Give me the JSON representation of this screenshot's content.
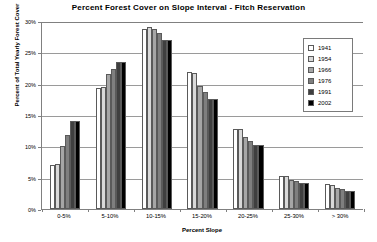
{
  "chart_data": {
    "type": "bar",
    "title": "Percent Forest Cover on Slope Interval - Fitch Reservation",
    "xlabel": "Percent Slope",
    "ylabel": "Percent of Total Yearly Forest Cover",
    "categories": [
      "0-5%",
      "5-10%",
      "10-15%",
      "15-20%",
      "20-25%",
      "25-30%",
      "> 30%"
    ],
    "ylim": [
      0,
      30
    ],
    "ytick_labels": [
      "0%",
      "5%",
      "10%",
      "15%",
      "20%",
      "25%",
      "30%"
    ],
    "ytick_values": [
      0,
      5,
      10,
      15,
      20,
      25,
      30
    ],
    "grid": true,
    "legend_position": "right-inside",
    "series": [
      {
        "name": "1941",
        "color": "#ffffff",
        "values": [
          7.0,
          19.3,
          28.8,
          21.9,
          12.7,
          5.3,
          4.0
        ]
      },
      {
        "name": "1954",
        "color": "#d9d9d9",
        "values": [
          7.2,
          19.5,
          29.0,
          21.7,
          12.7,
          5.2,
          3.8
        ]
      },
      {
        "name": "1966",
        "color": "#a6a6a6",
        "values": [
          10.0,
          21.6,
          28.7,
          19.6,
          11.5,
          4.7,
          3.4
        ]
      },
      {
        "name": "1976",
        "color": "#7f7f7f",
        "values": [
          11.8,
          22.4,
          28.1,
          18.7,
          10.9,
          4.4,
          3.2
        ]
      },
      {
        "name": "1991",
        "color": "#3f3f3f",
        "values": [
          14.1,
          23.5,
          26.9,
          17.5,
          10.2,
          4.2,
          2.9
        ]
      },
      {
        "name": "2002",
        "color": "#000000",
        "values": [
          14.1,
          23.5,
          26.9,
          17.5,
          10.2,
          4.2,
          2.9
        ]
      }
    ]
  }
}
